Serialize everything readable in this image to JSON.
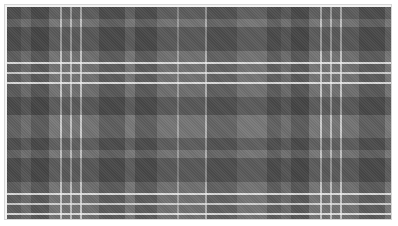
{
  "image": {
    "subject": "grey tartan plaid fabric swatch",
    "colors": {
      "base": "#6e6e6e",
      "dark_band": "#4a4a4a",
      "light_line": "#f0f0f0",
      "frame": "#f2f2f2",
      "frame_border": "#d6d6d6"
    }
  }
}
